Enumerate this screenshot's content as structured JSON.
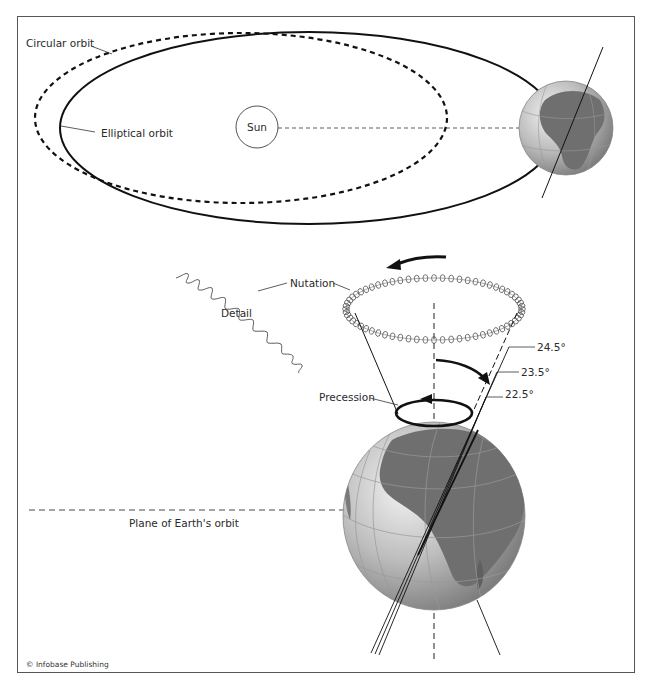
{
  "figure": {
    "credit": "© Infobase Publishing"
  },
  "orbit_panel": {
    "labels": {
      "circular_orbit": "Circular orbit",
      "elliptical_orbit": "Elliptical orbit",
      "sun": "Sun"
    }
  },
  "axis_panel": {
    "labels": {
      "nutation": "Nutation",
      "detail": "Detail",
      "precession": "Precession",
      "plane": "Plane of Earth's orbit"
    },
    "tilt_angles": [
      "24.5°",
      "23.5°",
      "22.5°"
    ]
  },
  "colors": {
    "line": "#111111",
    "frame": "#555555",
    "globe_ocean": "#c9c9c9",
    "globe_land": "#6f6f6f"
  }
}
